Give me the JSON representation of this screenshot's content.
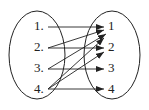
{
  "diagram": {
    "type": "mapping",
    "left_set": [
      "1",
      "2",
      "3",
      "4"
    ],
    "right_set": [
      "1",
      "2",
      "3",
      "4"
    ],
    "mappings": [
      {
        "from": "1",
        "to": "1"
      },
      {
        "from": "2",
        "to": "1"
      },
      {
        "from": "2",
        "to": "2"
      },
      {
        "from": "3",
        "to": "1"
      },
      {
        "from": "3",
        "to": "3"
      },
      {
        "from": "4",
        "to": "1"
      },
      {
        "from": "4",
        "to": "2"
      },
      {
        "from": "4",
        "to": "4"
      }
    ]
  },
  "left": {
    "l1": "1.",
    "l2": "2.",
    "l3": "3.",
    "l4": "4."
  },
  "right": {
    "r1": "1",
    "r2": "2",
    "r3": "3",
    "r4": "4"
  }
}
